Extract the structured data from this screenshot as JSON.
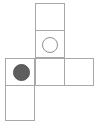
{
  "figure": {
    "name": "grid-puzzle-figure",
    "canvas": {
      "width": 100,
      "height": 126
    },
    "background_color": "#ffffff",
    "cell": {
      "width": 30,
      "height": 28,
      "border_color": "#a8a8a8",
      "fill_color": "#ffffff",
      "border_width": 1
    },
    "grid": {
      "columns": 3,
      "rows": 4,
      "x_lines": [
        5,
        35,
        64,
        94
      ],
      "y_lines": [
        3,
        30,
        58,
        85,
        120
      ]
    },
    "cells": [
      {
        "id": "cell-r1c2",
        "row": 1,
        "col": 2,
        "left": 35,
        "top": 3,
        "width": 30,
        "height": 28,
        "content": "empty"
      },
      {
        "id": "cell-r2c2",
        "row": 2,
        "col": 2,
        "left": 35,
        "top": 30,
        "width": 30,
        "height": 28,
        "content": "hollow-circle"
      },
      {
        "id": "cell-r3c1",
        "row": 3,
        "col": 1,
        "left": 5,
        "top": 58,
        "width": 30,
        "height": 28,
        "content": "filled-circle"
      },
      {
        "id": "cell-r3c2",
        "row": 3,
        "col": 2,
        "left": 35,
        "top": 58,
        "width": 30,
        "height": 28,
        "content": "empty"
      },
      {
        "id": "cell-r3c3",
        "row": 3,
        "col": 3,
        "left": 64,
        "top": 58,
        "width": 30,
        "height": 28,
        "content": "empty"
      },
      {
        "id": "cell-r4c1",
        "row": 4,
        "col": 1,
        "left": 5,
        "top": 85,
        "width": 30,
        "height": 36,
        "content": "empty"
      }
    ],
    "tokens": [
      {
        "id": "token-hollow",
        "kind": "hollow-circle",
        "cell": "cell-r2c2",
        "left": 42,
        "top": 37,
        "diameter": 16,
        "fill_color": "none",
        "stroke_color": "#8f8f8f"
      },
      {
        "id": "token-filled",
        "kind": "filled-circle",
        "cell": "cell-r3c1",
        "left": 13,
        "top": 64,
        "diameter": 17,
        "fill_color": "#5e5e5e",
        "stroke_color": "#565656"
      }
    ]
  }
}
